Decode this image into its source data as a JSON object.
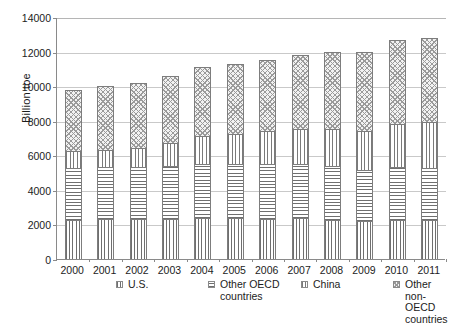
{
  "chart_data": {
    "type": "bar",
    "subtype": "stacked-vertical",
    "title": "",
    "xlabel": "",
    "ylabel": "Billion toe",
    "ylim": [
      0,
      14000
    ],
    "ytick_step": 2000,
    "ytick_labels": [
      "0",
      "2000",
      "4000",
      "6000",
      "8000",
      "10000",
      "12000",
      "14000"
    ],
    "ytick_values": [
      0,
      2000,
      4000,
      6000,
      8000,
      10000,
      12000,
      14000
    ],
    "grid": "horizontal",
    "legend_position": "bottom",
    "categories": [
      "2000",
      "2001",
      "2002",
      "2003",
      "2004",
      "2005",
      "2006",
      "2007",
      "2008",
      "2009",
      "2010",
      "2011"
    ],
    "series": [
      {
        "name": "U.S.",
        "pattern": "vertical-lines",
        "values": [
          2280,
          2290,
          2300,
          2330,
          2380,
          2360,
          2340,
          2350,
          2280,
          2180,
          2250,
          2230
        ]
      },
      {
        "name": "Other OECD\ncountries",
        "pattern": "horizontal-lines",
        "values": [
          3000,
          3010,
          3030,
          3060,
          3130,
          3140,
          3140,
          3150,
          3080,
          2950,
          3060,
          3020
        ]
      },
      {
        "name": "China",
        "pattern": "vertical-lines",
        "values": [
          980,
          1020,
          1120,
          1330,
          1590,
          1760,
          1920,
          2050,
          2150,
          2280,
          2480,
          2670
        ]
      },
      {
        "name": "Other non-OECD\ncountries",
        "pattern": "diagonal-crosshatch",
        "values": [
          3540,
          3680,
          3750,
          3880,
          4000,
          4040,
          4100,
          4250,
          4490,
          4590,
          4910,
          4880
        ]
      }
    ],
    "totals": [
      9800,
      10000,
      10200,
      10600,
      11100,
      11300,
      11500,
      11800,
      12000,
      12000,
      12700,
      12800
    ]
  },
  "legend": {
    "items": [
      {
        "label": "U.S.",
        "swatch": "us"
      },
      {
        "label": "Other OECD\ncountries",
        "swatch": "oecd"
      },
      {
        "label": "China",
        "swatch": "china"
      },
      {
        "label": "Other non-OECD\ncountries",
        "swatch": "nonoecd"
      }
    ]
  }
}
